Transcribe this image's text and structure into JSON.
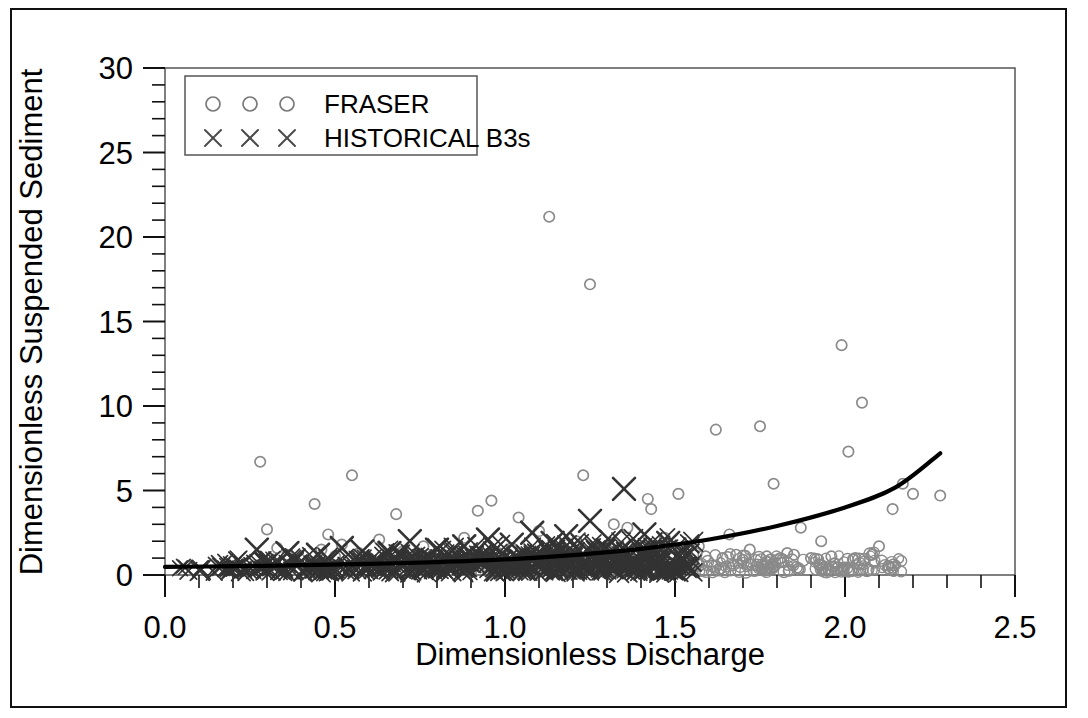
{
  "figure": {
    "background_color": "#ffffff",
    "border_color": "#111111"
  },
  "chart_data": {
    "type": "scatter",
    "title": "",
    "xlabel": "Dimensionless Discharge",
    "ylabel": "Dimensionless Suspended Sediment",
    "xlim": [
      0.0,
      2.5
    ],
    "ylim": [
      0,
      30
    ],
    "xticks": [
      "0.0",
      "0.5",
      "1.0",
      "1.5",
      "2.0",
      "2.5"
    ],
    "xtick_values": [
      0.0,
      0.5,
      1.0,
      1.5,
      2.0,
      2.5
    ],
    "yticks": [
      "0",
      "5",
      "10",
      "15",
      "20",
      "25",
      "30"
    ],
    "ytick_values": [
      0,
      5,
      10,
      15,
      20,
      25,
      30
    ],
    "xminor_step": 0.1,
    "yminor_step": 1,
    "grid": false,
    "legend_position": "upper left",
    "legend": [
      {
        "label": "FRASER",
        "marker": "circle",
        "color": "#7a7a7a"
      },
      {
        "label": "HISTORICAL B3s",
        "marker": "x",
        "color": "#4a4a4a"
      }
    ],
    "series": [
      {
        "name": "FRASER",
        "marker": "circle",
        "color": "#8a8a8a",
        "points": [
          [
            0.28,
            6.7
          ],
          [
            0.3,
            2.7
          ],
          [
            0.33,
            1.6
          ],
          [
            0.36,
            1.2
          ],
          [
            0.4,
            0.9
          ],
          [
            0.44,
            4.2
          ],
          [
            0.46,
            1.5
          ],
          [
            0.48,
            2.4
          ],
          [
            0.5,
            1.1
          ],
          [
            0.52,
            1.8
          ],
          [
            0.55,
            5.9
          ],
          [
            0.57,
            1.3
          ],
          [
            0.6,
            1.0
          ],
          [
            0.63,
            2.1
          ],
          [
            0.66,
            0.8
          ],
          [
            0.68,
            3.6
          ],
          [
            0.7,
            1.4
          ],
          [
            0.73,
            0.9
          ],
          [
            0.76,
            1.7
          ],
          [
            0.79,
            1.0
          ],
          [
            0.82,
            1.2
          ],
          [
            0.85,
            0.7
          ],
          [
            0.88,
            2.2
          ],
          [
            0.9,
            1.1
          ],
          [
            0.92,
            3.8
          ],
          [
            0.94,
            0.9
          ],
          [
            0.96,
            4.4
          ],
          [
            0.98,
            1.3
          ],
          [
            1.0,
            0.8
          ],
          [
            1.02,
            1.6
          ],
          [
            1.04,
            3.4
          ],
          [
            1.06,
            1.0
          ],
          [
            1.08,
            0.9
          ],
          [
            1.1,
            2.6
          ],
          [
            1.12,
            1.2
          ],
          [
            1.13,
            21.2
          ],
          [
            1.15,
            0.8
          ],
          [
            1.17,
            1.4
          ],
          [
            1.19,
            1.0
          ],
          [
            1.21,
            2.0
          ],
          [
            1.23,
            5.9
          ],
          [
            1.25,
            17.2
          ],
          [
            1.26,
            1.1
          ],
          [
            1.28,
            0.9
          ],
          [
            1.3,
            1.5
          ],
          [
            1.32,
            3.0
          ],
          [
            1.34,
            1.0
          ],
          [
            1.36,
            2.8
          ],
          [
            1.38,
            1.2
          ],
          [
            1.4,
            0.8
          ],
          [
            1.42,
            4.5
          ],
          [
            1.43,
            3.9
          ],
          [
            1.45,
            1.1
          ],
          [
            1.47,
            2.2
          ],
          [
            1.49,
            1.0
          ],
          [
            1.51,
            4.8
          ],
          [
            1.53,
            1.3
          ],
          [
            1.55,
            0.9
          ],
          [
            1.57,
            1.7
          ],
          [
            1.59,
            1.1
          ],
          [
            1.62,
            8.6
          ],
          [
            1.64,
            1.0
          ],
          [
            1.66,
            2.4
          ],
          [
            1.68,
            1.2
          ],
          [
            1.7,
            0.9
          ],
          [
            1.72,
            1.5
          ],
          [
            1.75,
            8.8
          ],
          [
            1.77,
            1.1
          ],
          [
            1.79,
            5.4
          ],
          [
            1.81,
            1.0
          ],
          [
            1.83,
            1.3
          ],
          [
            1.85,
            1.2
          ],
          [
            1.87,
            2.8
          ],
          [
            1.9,
            1.0
          ],
          [
            1.93,
            2.0
          ],
          [
            1.96,
            1.1
          ],
          [
            1.99,
            13.6
          ],
          [
            2.01,
            7.3
          ],
          [
            2.03,
            1.0
          ],
          [
            2.05,
            10.2
          ],
          [
            2.08,
            1.2
          ],
          [
            2.1,
            1.7
          ],
          [
            2.14,
            3.9
          ],
          [
            2.17,
            5.4
          ],
          [
            2.2,
            4.8
          ],
          [
            2.28,
            4.7
          ]
        ]
      },
      {
        "name": "HISTORICAL B3s",
        "marker": "x",
        "color": "#333333",
        "points": [
          [
            0.27,
            1.5
          ],
          [
            0.36,
            1.3
          ],
          [
            0.45,
            1.2
          ],
          [
            0.52,
            1.6
          ],
          [
            0.58,
            1.4
          ],
          [
            0.66,
            1.3
          ],
          [
            0.72,
            2.0
          ],
          [
            0.8,
            1.5
          ],
          [
            0.88,
            1.7
          ],
          [
            0.95,
            2.1
          ],
          [
            1.02,
            1.8
          ],
          [
            1.08,
            2.5
          ],
          [
            1.14,
            1.9
          ],
          [
            1.18,
            2.3
          ],
          [
            1.25,
            3.2
          ],
          [
            1.31,
            2.0
          ],
          [
            1.35,
            5.1
          ],
          [
            1.41,
            2.4
          ],
          [
            1.48,
            1.9
          ]
        ]
      }
    ],
    "fit_curve": {
      "name": "fitted-rating-curve",
      "color": "#000000",
      "points": [
        [
          0.0,
          0.48
        ],
        [
          0.2,
          0.52
        ],
        [
          0.4,
          0.58
        ],
        [
          0.6,
          0.66
        ],
        [
          0.8,
          0.76
        ],
        [
          1.0,
          0.92
        ],
        [
          1.2,
          1.18
        ],
        [
          1.4,
          1.55
        ],
        [
          1.6,
          2.1
        ],
        [
          1.8,
          2.9
        ],
        [
          2.0,
          4.0
        ],
        [
          2.15,
          5.2
        ],
        [
          2.28,
          7.2
        ]
      ]
    }
  }
}
